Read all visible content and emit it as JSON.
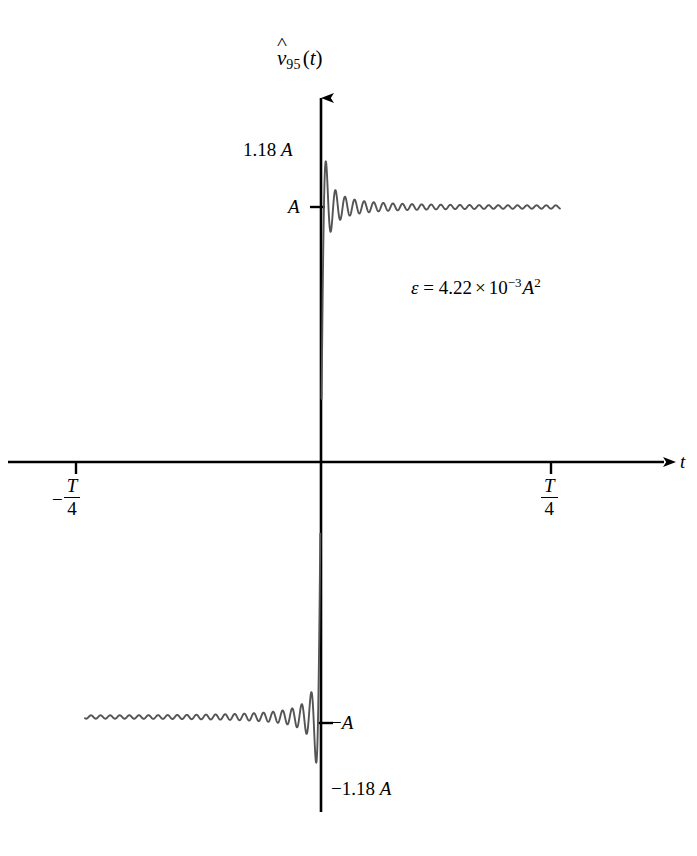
{
  "figure": {
    "y_axis_label": {
      "base": "v",
      "accent": "hat",
      "subscript": "95",
      "argument": "(t)",
      "full": "v̂95(t)"
    },
    "x_axis_label": "t",
    "annotation": {
      "symbol": "ε",
      "equals": "=",
      "mantissa": "4.22",
      "times": "×",
      "base": "10",
      "exponent": "−3",
      "unit_base": "A",
      "unit_exponent": "2",
      "full": "ε = 4.22 × 10⁻³A²"
    },
    "y_labels": {
      "overshoot_positive": "1.18 A",
      "amplitude_positive": "A",
      "amplitude_negative": "−A",
      "overshoot_negative": "−1.18 A"
    },
    "x_tick_labels": {
      "left": {
        "sign": "−",
        "numerator": "T",
        "denominator": "4"
      },
      "right": {
        "sign": "",
        "numerator": "T",
        "denominator": "4"
      }
    },
    "colors": {
      "axis": "#000000",
      "curve": "#555555",
      "background": "#ffffff",
      "text": "#000000"
    }
  },
  "chart_data": {
    "type": "line",
    "title": "",
    "subtitle": "",
    "xlabel": "t",
    "ylabel": "v̂95(t)",
    "series_name": "v̂95(t)",
    "n_harmonics": 95,
    "waveform": "square",
    "amplitude_symbol": "A",
    "amplitude_value": 1,
    "period_symbol": "T",
    "grid": false,
    "legend": false,
    "legend_position": "none",
    "xlim": [
      -0.25,
      0.3
    ],
    "ylim": [
      -1.25,
      1.25
    ],
    "x_ticks": [
      -0.25,
      0.25
    ],
    "x_tick_labels": [
      "−T/4",
      "T/4"
    ],
    "y_ticks": [
      -1,
      1
    ],
    "y_tick_labels": [
      "−A",
      "A"
    ],
    "annotations": [
      {
        "text": "1.18 A",
        "x": -0.05,
        "y": 1.18
      },
      {
        "text": "−1.18 A",
        "x": 0.02,
        "y": -1.18
      },
      {
        "text": "ε = 4.22 × 10⁻³A²",
        "x": 0.08,
        "y": 0.62
      }
    ],
    "overshoot_ratio": 1.18,
    "approximation_error_energy": 0.00422,
    "error_energy_text": "4.22e-3 A^2",
    "x_range_drawn": {
      "t_start": -0.25,
      "t_end": 0.27
    }
  },
  "geometry": {
    "origin_x": 321,
    "origin_y": 462,
    "y_axis_top": 90,
    "y_axis_bottom": 812,
    "x_axis_left": 8,
    "x_axis_right": 672,
    "amp_pos_y": 207,
    "amp_neg_y": 723,
    "tick_left_x": 76,
    "tick_right_x": 551,
    "curve_left_x": 85,
    "curve_right_x": 560
  }
}
